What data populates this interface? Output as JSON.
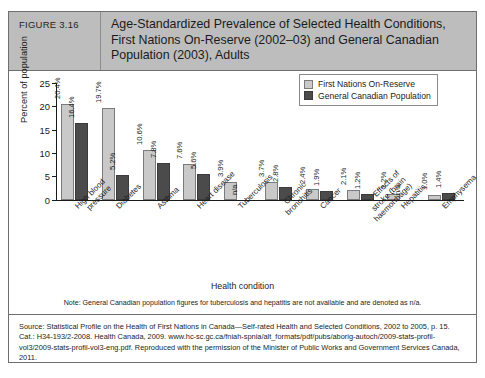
{
  "figure": {
    "number_label": "FIGURE 3.16",
    "title": "Age-Standardized Prevalence of Selected Health Conditions, First Nations On-Reserve (2002–03) and General Canadian Population (2003), Adults",
    "note": "Note: General Canadian population figures for tuberculosis and hepatitis are not available and are denoted as n/a.",
    "source": "Source: Statistical Profile on the Health of First Nations in Canada—Self-rated Health and Selected Conditions, 2002 to 2005, p. 15. Cat.: H34-193/2-2008. Health Canada, 2009. www.hc-sc.gc.ca/fniah-spnia/alt_formats/pdf/pubs/aborig-autoch/2009-stats-profil-vol3/2009-stats-profil-vol3-eng.pdf. Reproduced with the permission of the Minister of Public Works and Government Services Canada, 2011."
  },
  "colors": {
    "series1": "#c9c9c9",
    "series2": "#4b4b4b",
    "header_band": "#bdbdbd",
    "frame": "#6f6f6f"
  },
  "chart_data": {
    "type": "bar",
    "title": "Age-Standardized Prevalence of Selected Health Conditions, First Nations On-Reserve (2002–03) and General Canadian Population (2003), Adults",
    "xlabel": "Health condition",
    "ylabel": "Percent of population",
    "ylim": [
      0,
      25
    ],
    "yticks": [
      0,
      5,
      10,
      15,
      20,
      25
    ],
    "ytick_labels": [
      "0",
      "5",
      "10",
      "15",
      "20",
      "25"
    ],
    "grid": false,
    "legend_position": "top-right",
    "categories": [
      "High blood pressure",
      "Diabetes",
      "Asthma",
      "Heart disease",
      "Tuberculosis",
      "Chronic bronchitis",
      "Cancer",
      "Effects of stroke (brain haemorrhage)",
      "Hepatitis",
      "Emphysema"
    ],
    "category_lines": [
      [
        "High blood",
        "pressure"
      ],
      [
        "Diabetes"
      ],
      [
        "Asthma"
      ],
      [
        "Heart disease"
      ],
      [
        "Tuberculosis"
      ],
      [
        "Chronic",
        "bronchitis"
      ],
      [
        "Cancer"
      ],
      [
        "Effects of",
        "stroke (brain",
        "haemorrhage)"
      ],
      [
        "Hepatitis"
      ],
      [
        "Emphysema"
      ]
    ],
    "series": [
      {
        "name": "First Nations On-Reserve",
        "color": "#c9c9c9",
        "values": [
          20.4,
          19.7,
          10.6,
          7.6,
          3.9,
          3.7,
          2.4,
          2.1,
          1.2,
          1.0
        ],
        "labels": [
          "20.4%",
          "19.7%",
          "10.6%",
          "7.6%",
          "3.9%",
          "3.7%",
          "2.4%",
          "2.1%",
          "1.2%",
          "1.0%"
        ]
      },
      {
        "name": "General Canadian Population",
        "color": "#4b4b4b",
        "values": [
          16.4,
          5.2,
          7.8,
          5.6,
          null,
          2.8,
          1.9,
          1.2,
          null,
          1.4
        ],
        "labels": [
          "16.4%",
          "5.2%",
          "7.8%",
          "5.6%",
          "n/a",
          "2.8%",
          "1.9%",
          "1.2%",
          "n/a",
          "1.4%"
        ]
      }
    ]
  }
}
